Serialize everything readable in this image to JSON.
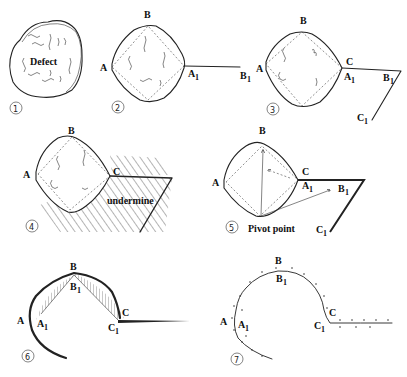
{
  "figure": {
    "panels": [
      {
        "step": "①",
        "labels": [
          "Defect"
        ]
      },
      {
        "step": "②",
        "labels": [
          "A",
          "B",
          "A",
          "1",
          "B",
          "1"
        ]
      },
      {
        "step": "③",
        "labels": [
          "A",
          "B",
          "C",
          "A",
          "1",
          "B",
          "1",
          "C",
          "1"
        ]
      },
      {
        "step": "④",
        "labels": [
          "A",
          "B",
          "C",
          "undermine"
        ]
      },
      {
        "step": "⑤",
        "labels": [
          "A",
          "B",
          "C",
          "A",
          "1",
          "B",
          "1",
          "C",
          "1",
          "Pivot point"
        ]
      },
      {
        "step": "⑥",
        "labels": [
          "A",
          "A",
          "1",
          "B",
          "B",
          "1",
          "C",
          "C",
          "1"
        ]
      },
      {
        "step": "⑦",
        "labels": [
          "A",
          "A",
          "1",
          "B",
          "B",
          "1",
          "C",
          "C",
          "1"
        ]
      }
    ]
  },
  "p1": {
    "num": "①",
    "defect": "Defect"
  },
  "p2": {
    "num": "②",
    "A": "A",
    "B": "B",
    "A1": "A",
    "B1": "B",
    "sub": "1"
  },
  "p3": {
    "num": "③",
    "A": "A",
    "B": "B",
    "C": "C",
    "A1": "A",
    "B1": "B",
    "C1": "C",
    "sub": "1"
  },
  "p4": {
    "num": "④",
    "A": "A",
    "B": "B",
    "C": "C",
    "undermine": "undermine"
  },
  "p5": {
    "num": "⑤",
    "A": "A",
    "B": "B",
    "C": "C",
    "A1": "A",
    "B1": "B",
    "C1": "C",
    "sub": "1",
    "pivot": "Pivot point"
  },
  "p6": {
    "num": "⑥",
    "A": "A",
    "A1": "A",
    "B": "B",
    "B1": "B",
    "C": "C",
    "C1": "C",
    "sub": "1"
  },
  "p7": {
    "num": "⑦",
    "A": "A",
    "A1": "A",
    "B": "B",
    "B1": "B",
    "C": "C",
    "C1": "C",
    "sub": "1"
  }
}
